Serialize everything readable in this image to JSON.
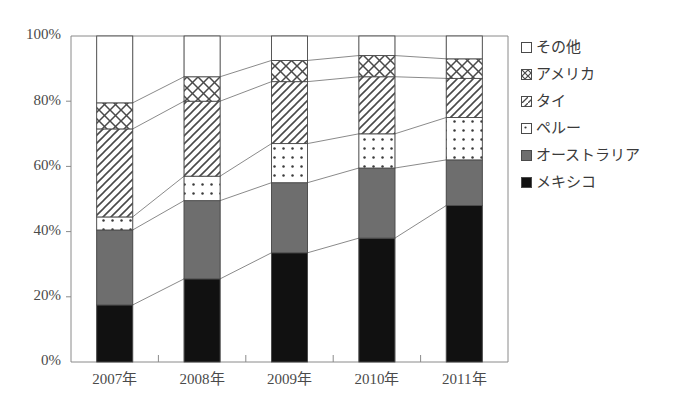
{
  "chart_data": {
    "type": "bar",
    "stacked": true,
    "normalized": true,
    "title": "",
    "xlabel": "",
    "ylabel": "",
    "ylim": [
      0,
      100
    ],
    "ytick_labels": [
      "0%",
      "20%",
      "40%",
      "60%",
      "80%",
      "100%"
    ],
    "ytick_values": [
      0,
      20,
      40,
      60,
      80,
      100
    ],
    "grid": false,
    "legend_position": "right",
    "categories": [
      "2007年",
      "2008年",
      "2009年",
      "2010年",
      "2011年"
    ],
    "series": [
      {
        "name": "メキシコ",
        "pattern": "solid-black",
        "color": "#111111",
        "values": [
          17.5,
          25.5,
          33.5,
          38.0,
          48.0
        ]
      },
      {
        "name": "オーストラリア",
        "pattern": "solid-gray",
        "color": "#6e6e6e",
        "values": [
          23.0,
          24.0,
          21.5,
          21.5,
          14.0
        ]
      },
      {
        "name": "ペルー",
        "pattern": "dotted",
        "color": "#ffffff",
        "values": [
          4.0,
          7.5,
          12.0,
          10.5,
          13.0
        ]
      },
      {
        "name": "タイ",
        "pattern": "diagonal",
        "color": "#ffffff",
        "values": [
          27.0,
          23.0,
          19.0,
          17.5,
          12.0
        ]
      },
      {
        "name": "アメリカ",
        "pattern": "crosshatch",
        "color": "#ffffff",
        "values": [
          8.0,
          7.5,
          6.5,
          6.5,
          6.0
        ]
      },
      {
        "name": "その他",
        "pattern": "empty",
        "color": "#ffffff",
        "values": [
          20.5,
          12.5,
          7.5,
          6.0,
          7.0
        ]
      }
    ],
    "cumulative_tops": [
      [
        17.5,
        40.5,
        44.5,
        71.5,
        79.5,
        100.0
      ],
      [
        25.5,
        49.5,
        57.0,
        80.0,
        87.5,
        100.0
      ],
      [
        33.5,
        55.0,
        67.0,
        86.0,
        92.5,
        100.0
      ],
      [
        38.0,
        59.5,
        70.0,
        87.5,
        94.0,
        100.0
      ],
      [
        48.0,
        62.0,
        75.0,
        87.0,
        93.0,
        100.0
      ]
    ]
  },
  "legend": {
    "items": [
      {
        "label": "その他",
        "pattern": "empty"
      },
      {
        "label": "アメリカ",
        "pattern": "crosshatch"
      },
      {
        "label": "タイ",
        "pattern": "diagonal"
      },
      {
        "label": "ペルー",
        "pattern": "dotted"
      },
      {
        "label": "オーストラリア",
        "pattern": "solid-gray"
      },
      {
        "label": "メキシコ",
        "pattern": "solid-black"
      }
    ]
  },
  "colors": {
    "black": "#111111",
    "gray": "#6e6e6e",
    "white": "#ffffff",
    "outline": "#4a4a4a",
    "axis": "#8a8a8a"
  }
}
